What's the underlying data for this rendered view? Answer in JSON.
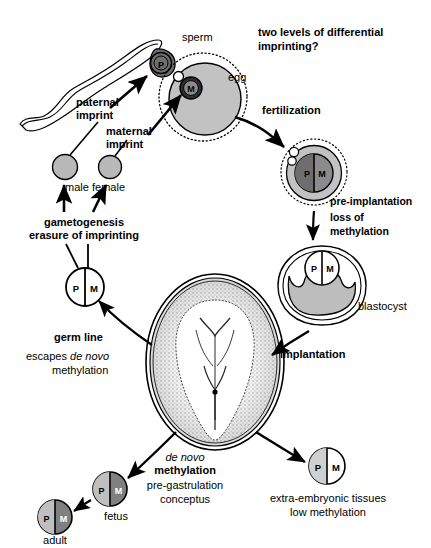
{
  "figure": {
    "title_note": "two levels of differential imprinting?"
  },
  "nucleus_letters": {
    "paternal": "P",
    "maternal": "M"
  },
  "labels": {
    "sperm": "sperm",
    "egg": "egg",
    "paternal_imprint_l1": "paternal",
    "paternal_imprint_l2": "imprint",
    "maternal_imprint_l1": "maternal",
    "maternal_imprint_l2": "imprint",
    "two_levels_l1": "two levels of differential",
    "two_levels_l2": "imprinting?",
    "fertilization": "fertilization",
    "pre_implantation_l1": "pre-implantation",
    "pre_implantation_l2": "loss of",
    "pre_implantation_l3": "methylation",
    "blastocyst": "blastocyst",
    "implantation": "implantation",
    "male": "male",
    "female": "female",
    "gametogenesis": "gametogenesis",
    "erasure": "erasure of imprinting",
    "germ_line": "germ line",
    "escapes_l1_a": "escapes ",
    "escapes_l1_b": "de novo",
    "escapes_l2": "methylation",
    "de_novo_italic": "de novo",
    "de_novo_methylation": "methylation",
    "pre_gastrulation": "pre-gastrulation",
    "conceptus": "conceptus",
    "extra_embryonic_l1": "extra-embryonic tissues",
    "extra_embryonic_l2": "low methylation",
    "fetus": "fetus",
    "adult": "adult"
  },
  "colors": {
    "ink": "#000000",
    "page": "#ffffff",
    "gamete_gray": "#b9b9b9",
    "cytoplasm_gray": "#c2c2c2",
    "nucleus_dark": "#6e6e6e",
    "nucleus_mid": "#9a9a9a",
    "nucleus_light": "#d0d0d0",
    "blastocyst_gray": "#bdbdbd",
    "white": "#ffffff"
  },
  "nodes": [
    {
      "name": "sperm",
      "label": "sperm",
      "nucleus": [
        "P"
      ],
      "fill": "nucleus_dark"
    },
    {
      "name": "egg",
      "label": "egg",
      "nucleus": [
        "M"
      ],
      "fill": "cytoplasm_gray"
    },
    {
      "name": "zygote",
      "label": "",
      "nucleus": [
        "P",
        "M"
      ],
      "fill": "cytoplasm_gray"
    },
    {
      "name": "blastocyst",
      "label": "blastocyst",
      "nucleus": [
        "P",
        "M"
      ],
      "fill": "blastocyst_gray"
    },
    {
      "name": "conceptus",
      "label": "pre-gastrulation conceptus",
      "nucleus": [],
      "fill": "white"
    },
    {
      "name": "extra-embryonic",
      "label": "extra-embryonic tissues low methylation",
      "nucleus": [
        "P",
        "M"
      ],
      "fill": "nucleus_light"
    },
    {
      "name": "fetus",
      "label": "fetus",
      "nucleus": [
        "P",
        "M"
      ],
      "fill": "nucleus_mid"
    },
    {
      "name": "adult",
      "label": "adult",
      "nucleus": [
        "P",
        "M"
      ],
      "fill": "nucleus_mid"
    },
    {
      "name": "germ-line",
      "label": "germ line",
      "nucleus": [
        "P",
        "M"
      ],
      "fill": "white"
    },
    {
      "name": "male-gamete",
      "label": "male",
      "nucleus": [],
      "fill": "gamete_gray"
    },
    {
      "name": "female-gamete",
      "label": "female",
      "nucleus": [],
      "fill": "gamete_gray"
    }
  ],
  "arrows": [
    {
      "from": "paternal-imprint-text",
      "to": "sperm"
    },
    {
      "from": "maternal-imprint-text",
      "to": "egg"
    },
    {
      "from": "egg",
      "to": "zygote",
      "label": "fertilization"
    },
    {
      "from": "zygote",
      "to": "blastocyst",
      "label": "pre-implantation loss of methylation"
    },
    {
      "from": "blastocyst",
      "to": "conceptus",
      "label": "implantation"
    },
    {
      "from": "conceptus",
      "to": "fetus",
      "label": "de novo methylation"
    },
    {
      "from": "conceptus",
      "to": "extra-embryonic",
      "label": ""
    },
    {
      "from": "fetus",
      "to": "adult"
    },
    {
      "from": "conceptus",
      "to": "germ-line",
      "label": "germ line escapes de novo methylation"
    },
    {
      "from": "germ-line",
      "to": "male-gamete",
      "label": "gametogenesis erasure of imprinting"
    },
    {
      "from": "germ-line",
      "to": "female-gamete",
      "label": "gametogenesis erasure of imprinting"
    },
    {
      "from": "male-gamete",
      "to": "sperm"
    },
    {
      "from": "female-gamete",
      "to": "egg"
    }
  ]
}
